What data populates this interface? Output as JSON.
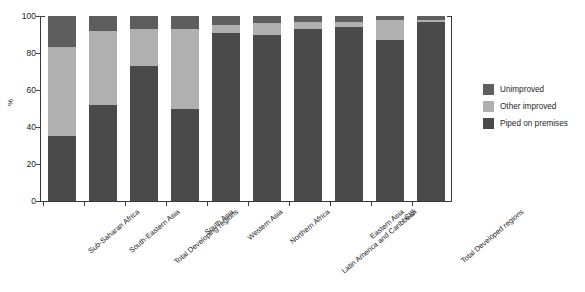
{
  "chart_data": {
    "type": "bar",
    "stacked": true,
    "title": "",
    "subtitle": "",
    "xlabel": "",
    "ylabel": "%",
    "ylim": [
      0,
      100
    ],
    "yticks": [
      0,
      20,
      40,
      60,
      80,
      100
    ],
    "grid": false,
    "legend_position": "right",
    "categories": [
      "Sub-Saharan Africa",
      "South-Eastern Asia",
      "Total Developing regions",
      "South Asia",
      "Western Asia",
      "Northern Africa",
      "Latin America and Caribbean",
      "Eastern Asia",
      "CIS",
      "Total Developed regions"
    ],
    "series": [
      {
        "name": "Piped on premises",
        "color": "#4a4a4a",
        "values": [
          35,
          52,
          73,
          50,
          91,
          90,
          93,
          94,
          87,
          97
        ]
      },
      {
        "name": "Other improved",
        "color": "#b0b0b0",
        "values": [
          48,
          40,
          20,
          43,
          4,
          6,
          4,
          3,
          11,
          1
        ]
      },
      {
        "name": "Unimproved",
        "color": "#5e5e5e",
        "values": [
          17,
          8,
          7,
          7,
          5,
          4,
          3,
          3,
          2,
          2
        ]
      }
    ]
  },
  "legend": {
    "items": [
      {
        "label": "Unimproved",
        "color": "#5e5e5e"
      },
      {
        "label": "Other improved",
        "color": "#b0b0b0"
      },
      {
        "label": "Piped on premises",
        "color": "#4a4a4a"
      }
    ]
  },
  "colors": {
    "axis": "#3a3a3a",
    "text": "#222222",
    "background": "#ffffff"
  }
}
